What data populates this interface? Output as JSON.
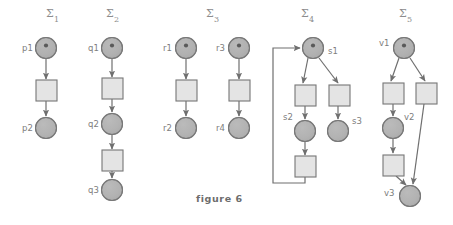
{
  "figure": {
    "caption": "figure 6",
    "caption_x": 196,
    "caption_y": 202,
    "width": 453,
    "height": 225,
    "background": "#ffffff",
    "ink_color": "#6f6f6f",
    "place_fill": "#b3b3b3",
    "transition_fill": "#e4e4e4",
    "stroke_color": "#767676"
  },
  "nets": [
    {
      "id": "sigma-1",
      "title": "Σ",
      "subscript": "1",
      "title_x": 46,
      "title_y": 17,
      "places": [
        {
          "name": "p1",
          "label": "p1",
          "cx": 46,
          "cy": 48,
          "r": 10.5,
          "marked": true,
          "label_x": 22,
          "label_y": 51
        },
        {
          "name": "p2",
          "label": "p2",
          "cx": 46,
          "cy": 128,
          "r": 10.5,
          "marked": false,
          "label_x": 22,
          "label_y": 131
        }
      ],
      "transitions": [
        {
          "name": "t1",
          "x": 36,
          "y": 80,
          "w": 21,
          "h": 21
        }
      ],
      "arcs": [
        {
          "from": "p1",
          "to": "t1",
          "x1": 46,
          "y1": 59,
          "x2": 46,
          "y2": 79
        },
        {
          "from": "t1",
          "to": "p2",
          "x1": 46,
          "y1": 101,
          "x2": 46,
          "y2": 116
        }
      ]
    },
    {
      "id": "sigma-2",
      "title": "Σ",
      "subscript": "2",
      "title_x": 106,
      "title_y": 17,
      "places": [
        {
          "name": "q1",
          "label": "q1",
          "cx": 112,
          "cy": 48,
          "r": 10.5,
          "marked": true,
          "label_x": 88,
          "label_y": 51
        },
        {
          "name": "q2",
          "label": "q2",
          "cx": 112,
          "cy": 124,
          "r": 10.5,
          "marked": false,
          "label_x": 88,
          "label_y": 127
        },
        {
          "name": "q3",
          "label": "q3",
          "cx": 112,
          "cy": 190,
          "r": 10.5,
          "marked": false,
          "label_x": 88,
          "label_y": 193
        }
      ],
      "transitions": [
        {
          "name": "t1",
          "x": 102,
          "y": 78,
          "w": 21,
          "h": 21
        },
        {
          "name": "t2",
          "x": 102,
          "y": 150,
          "w": 21,
          "h": 21
        }
      ],
      "arcs": [
        {
          "from": "q1",
          "to": "t1",
          "x1": 112,
          "y1": 59,
          "x2": 112,
          "y2": 77
        },
        {
          "from": "t1",
          "to": "q2",
          "x1": 112,
          "y1": 99,
          "x2": 112,
          "y2": 112
        },
        {
          "from": "q2",
          "to": "t2",
          "x1": 112,
          "y1": 135,
          "x2": 112,
          "y2": 149
        },
        {
          "from": "t2",
          "to": "q3",
          "x1": 112,
          "y1": 171,
          "x2": 112,
          "y2": 178
        }
      ]
    },
    {
      "id": "sigma-3",
      "title": "Σ",
      "subscript": "3",
      "title_x": 206,
      "title_y": 17,
      "places": [
        {
          "name": "r1",
          "label": "r1",
          "cx": 186,
          "cy": 48,
          "r": 10.5,
          "marked": true,
          "label_x": 163,
          "label_y": 51
        },
        {
          "name": "r2",
          "label": "r2",
          "cx": 186,
          "cy": 128,
          "r": 10.5,
          "marked": false,
          "label_x": 163,
          "label_y": 131
        },
        {
          "name": "r3",
          "label": "r3",
          "cx": 239,
          "cy": 48,
          "r": 10.5,
          "marked": true,
          "label_x": 216,
          "label_y": 51
        },
        {
          "name": "r4",
          "label": "r4",
          "cx": 239,
          "cy": 128,
          "r": 10.5,
          "marked": false,
          "label_x": 216,
          "label_y": 131
        }
      ],
      "transitions": [
        {
          "name": "t1",
          "x": 176,
          "y": 80,
          "w": 21,
          "h": 21
        },
        {
          "name": "t2",
          "x": 229,
          "y": 80,
          "w": 21,
          "h": 21
        }
      ],
      "arcs": [
        {
          "from": "r1",
          "to": "t1",
          "x1": 186,
          "y1": 59,
          "x2": 186,
          "y2": 79
        },
        {
          "from": "t1",
          "to": "r2",
          "x1": 186,
          "y1": 101,
          "x2": 186,
          "y2": 116
        },
        {
          "from": "r3",
          "to": "t2",
          "x1": 239,
          "y1": 59,
          "x2": 239,
          "y2": 79
        },
        {
          "from": "t2",
          "to": "r4",
          "x1": 239,
          "y1": 101,
          "x2": 239,
          "y2": 116
        }
      ]
    },
    {
      "id": "sigma-4",
      "title": "Σ",
      "subscript": "4",
      "title_x": 301,
      "title_y": 17,
      "places": [
        {
          "name": "s1",
          "label": "s1",
          "cx": 313,
          "cy": 48,
          "r": 10.5,
          "marked": true,
          "label_x": 328,
          "label_y": 54
        },
        {
          "name": "s2",
          "label": "s2",
          "cx": 305,
          "cy": 131,
          "r": 10.5,
          "marked": false,
          "label_x": 283,
          "label_y": 120
        },
        {
          "name": "s3",
          "label": "s3",
          "cx": 338,
          "cy": 131,
          "r": 10.5,
          "marked": false,
          "label_x": 352,
          "label_y": 124
        }
      ],
      "transitions": [
        {
          "name": "t1",
          "x": 295,
          "y": 85,
          "w": 21,
          "h": 21
        },
        {
          "name": "t2",
          "x": 329,
          "y": 85,
          "w": 21,
          "h": 21
        },
        {
          "name": "t3",
          "x": 295,
          "y": 156,
          "w": 21,
          "h": 21
        }
      ],
      "arcs": [
        {
          "from": "s1",
          "to": "t1",
          "x1": 308,
          "y1": 58,
          "x2": 303,
          "y2": 83
        },
        {
          "from": "s1",
          "to": "t2",
          "x1": 319,
          "y1": 58,
          "x2": 338,
          "y2": 83
        },
        {
          "from": "t1",
          "to": "s2",
          "x1": 305,
          "y1": 106,
          "x2": 305,
          "y2": 119
        },
        {
          "from": "t2",
          "to": "s3",
          "x1": 338,
          "y1": 106,
          "x2": 338,
          "y2": 119
        },
        {
          "from": "s2",
          "to": "t3",
          "x1": 305,
          "y1": 142,
          "x2": 305,
          "y2": 155
        }
      ],
      "feedback_arc": {
        "from": "t3",
        "to": "s1",
        "path": "M 305 177 L 305 183 L 273 183 L 273 48 L 300 48"
      }
    },
    {
      "id": "sigma-5",
      "title": "Σ",
      "subscript": "5",
      "title_x": 399,
      "title_y": 17,
      "places": [
        {
          "name": "v1",
          "label": "v1",
          "cx": 404,
          "cy": 48,
          "r": 10.5,
          "marked": true,
          "label_x": 379,
          "label_y": 46
        },
        {
          "name": "v2",
          "label": "v2",
          "cx": 393,
          "cy": 128,
          "r": 10.5,
          "marked": false,
          "label_x": 404,
          "label_y": 120
        },
        {
          "name": "v3",
          "label": "v3",
          "cx": 410,
          "cy": 196,
          "r": 10.5,
          "marked": false,
          "label_x": 384,
          "label_y": 196
        }
      ],
      "transitions": [
        {
          "name": "t1",
          "x": 383,
          "y": 83,
          "w": 21,
          "h": 21
        },
        {
          "name": "t2",
          "x": 416,
          "y": 83,
          "w": 21,
          "h": 21
        },
        {
          "name": "t3",
          "x": 383,
          "y": 155,
          "w": 21,
          "h": 21
        }
      ],
      "arcs": [
        {
          "from": "v1",
          "to": "t1",
          "x1": 399,
          "y1": 58,
          "x2": 391,
          "y2": 81
        },
        {
          "from": "v1",
          "to": "t2",
          "x1": 410,
          "y1": 58,
          "x2": 425,
          "y2": 81
        },
        {
          "from": "t1",
          "to": "v2",
          "x1": 393,
          "y1": 104,
          "x2": 393,
          "y2": 116
        },
        {
          "from": "v2",
          "to": "t3",
          "x1": 393,
          "y1": 139,
          "x2": 393,
          "y2": 153
        },
        {
          "from": "t3",
          "to": "v3",
          "x1": 396,
          "y1": 176,
          "x2": 406,
          "y2": 185
        },
        {
          "from": "t2",
          "to": "v3",
          "x1": 424,
          "y1": 104,
          "x2": 413,
          "y2": 184
        }
      ]
    }
  ]
}
